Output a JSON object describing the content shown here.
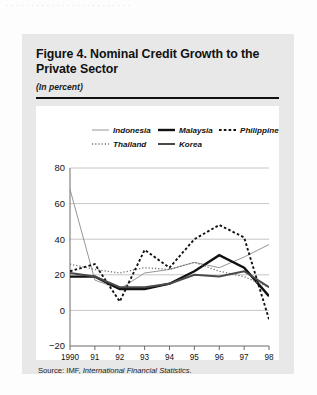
{
  "page": {
    "top_clipped_text": "· · · · · · · · · · · · · · · · · · · · · · · · ·"
  },
  "figure": {
    "title": "Figure 4.  Nominal Credit Growth to the Private Sector",
    "subtitle": "(In percent)",
    "source_prefix": "Source:  IMF,",
    "source_italic": "International Financial Statistics",
    "source_suffix": "."
  },
  "chart_data": {
    "type": "line",
    "title": "Figure 4.  Nominal Credit Growth to the Private Sector",
    "subtitle": "(In percent)",
    "xlabel": "",
    "ylabel": "",
    "ylim": [
      -20,
      80
    ],
    "yticks": [
      -20,
      0,
      20,
      40,
      60,
      80
    ],
    "ytick_labels": [
      "−20",
      "0",
      "20",
      "40",
      "60",
      "80"
    ],
    "x": [
      1990,
      1991,
      1992,
      1993,
      1994,
      1995,
      1996,
      1997,
      1998
    ],
    "xtick_labels": [
      "1990",
      "91",
      "92",
      "93",
      "94",
      "95",
      "96",
      "97",
      "98"
    ],
    "grid": true,
    "legend_position": "top-inside",
    "series": [
      {
        "name": "Indonesia",
        "style": "thin-solid",
        "color": "#8a8a8a",
        "values": [
          68,
          17,
          12,
          21,
          23,
          27,
          24,
          30,
          37
        ]
      },
      {
        "name": "Malaysia",
        "style": "thick-solid",
        "color": "#111111",
        "values": [
          19,
          19,
          12,
          12,
          15,
          22,
          31,
          24,
          8
        ]
      },
      {
        "name": "Philippines",
        "style": "coarse-dotted",
        "color": "#111111",
        "values": [
          22,
          26,
          5,
          34,
          24,
          40,
          48,
          41,
          -5
        ]
      },
      {
        "name": "Thailand",
        "style": "fine-dotted",
        "color": "#6f6f6f",
        "values": [
          26,
          23,
          21,
          24,
          23,
          27,
          22,
          19,
          13
        ]
      },
      {
        "name": "Korea",
        "style": "medium-solid",
        "color": "#4a4a4a",
        "values": [
          21,
          19,
          13,
          13,
          15,
          20,
          19,
          22,
          13
        ]
      }
    ]
  },
  "legend": {
    "items": [
      {
        "label": "Indonesia",
        "swatch": "thin-solid-swatch"
      },
      {
        "label": "Malaysia",
        "swatch": "thick-solid-swatch"
      },
      {
        "label": "Philippines",
        "swatch": "coarse-dotted-swatch"
      },
      {
        "label": "Thailand",
        "swatch": "fine-dotted-swatch"
      },
      {
        "label": "Korea",
        "swatch": "medium-solid-swatch"
      }
    ]
  }
}
